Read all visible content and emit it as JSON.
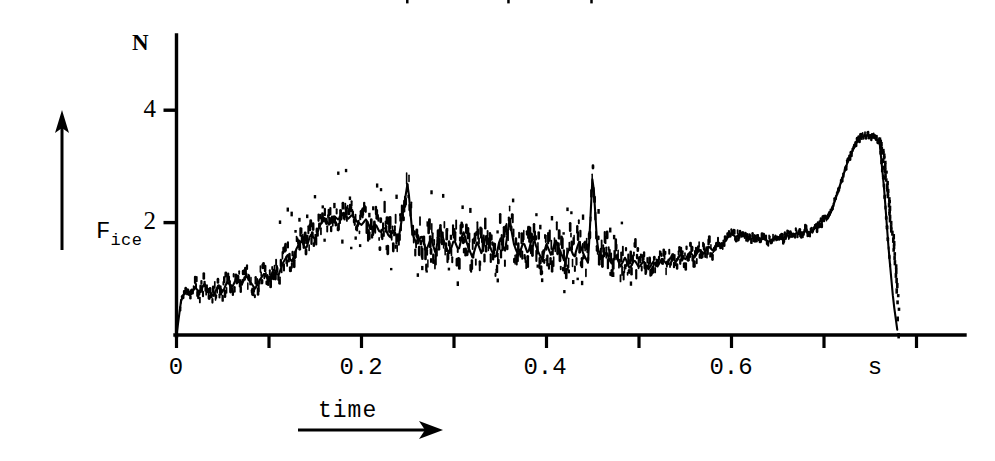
{
  "figure": {
    "background": "#ffffff",
    "ink_color": "#000000"
  },
  "axes": {
    "y_unit_label": "N",
    "y_axis_label_main": "F",
    "y_axis_label_sub": "ice",
    "y_ticks": [
      {
        "value": 2,
        "label": "2"
      },
      {
        "value": 4,
        "label": "4"
      }
    ],
    "x_ticks": [
      {
        "value": 0.0,
        "label": "0"
      },
      {
        "value": 0.1,
        "label": ""
      },
      {
        "value": 0.2,
        "label": "0.2"
      },
      {
        "value": 0.3,
        "label": ""
      },
      {
        "value": 0.4,
        "label": "0.4"
      },
      {
        "value": 0.5,
        "label": ""
      },
      {
        "value": 0.6,
        "label": "0.6"
      },
      {
        "value": 0.7,
        "label": ""
      },
      {
        "value": 0.8,
        "label": ""
      }
    ],
    "x_unit_label": "s",
    "x_axis_label": "time",
    "x_axis_arrow": "arrow-right",
    "y_axis_arrow": "arrow-up"
  },
  "chart_data": {
    "type": "line",
    "title": "",
    "subtitle": "",
    "xlabel": "time",
    "ylabel": "F_ice",
    "xunit": "s",
    "yunit": "N",
    "xlim": [
      0.0,
      0.83
    ],
    "ylim": [
      0.0,
      4.55
    ],
    "grid": false,
    "legend": null,
    "style": "noisy dotted oscilloscope trace, black ink on white",
    "annotations": [],
    "series": [
      {
        "name": "F_ice",
        "x": [
          0.0,
          0.005,
          0.01,
          0.015,
          0.02,
          0.025,
          0.03,
          0.035,
          0.04,
          0.045,
          0.05,
          0.055,
          0.06,
          0.065,
          0.07,
          0.075,
          0.08,
          0.085,
          0.09,
          0.095,
          0.1,
          0.105,
          0.11,
          0.115,
          0.12,
          0.125,
          0.13,
          0.135,
          0.14,
          0.145,
          0.15,
          0.155,
          0.16,
          0.165,
          0.17,
          0.175,
          0.18,
          0.185,
          0.19,
          0.195,
          0.2,
          0.205,
          0.21,
          0.215,
          0.22,
          0.225,
          0.23,
          0.235,
          0.24,
          0.245,
          0.25,
          0.255,
          0.26,
          0.265,
          0.27,
          0.275,
          0.28,
          0.285,
          0.29,
          0.295,
          0.3,
          0.305,
          0.31,
          0.315,
          0.32,
          0.325,
          0.33,
          0.335,
          0.34,
          0.345,
          0.35,
          0.355,
          0.36,
          0.365,
          0.37,
          0.375,
          0.38,
          0.385,
          0.39,
          0.395,
          0.4,
          0.405,
          0.41,
          0.415,
          0.42,
          0.425,
          0.43,
          0.435,
          0.44,
          0.445,
          0.45,
          0.455,
          0.46,
          0.465,
          0.47,
          0.475,
          0.48,
          0.485,
          0.49,
          0.495,
          0.5,
          0.505,
          0.51,
          0.515,
          0.52,
          0.525,
          0.53,
          0.535,
          0.54,
          0.545,
          0.55,
          0.555,
          0.56,
          0.565,
          0.57,
          0.575,
          0.58,
          0.585,
          0.59,
          0.595,
          0.6,
          0.605,
          0.61,
          0.615,
          0.62,
          0.625,
          0.63,
          0.635,
          0.64,
          0.645,
          0.65,
          0.655,
          0.66,
          0.665,
          0.67,
          0.675,
          0.68,
          0.685,
          0.69,
          0.695,
          0.7,
          0.705,
          0.71,
          0.715,
          0.72,
          0.725,
          0.73,
          0.735,
          0.74,
          0.745,
          0.75,
          0.755,
          0.76,
          0.765,
          0.77,
          0.775,
          0.78
        ],
        "y": [
          0.0,
          0.62,
          0.8,
          0.7,
          0.86,
          0.74,
          0.92,
          0.78,
          0.7,
          0.88,
          0.76,
          0.96,
          0.84,
          1.02,
          0.88,
          1.06,
          0.94,
          0.82,
          0.98,
          1.1,
          0.95,
          1.18,
          1.05,
          1.28,
          1.42,
          1.3,
          1.55,
          1.68,
          1.52,
          1.8,
          1.7,
          1.95,
          2.08,
          1.96,
          2.12,
          2.05,
          2.18,
          2.06,
          2.14,
          2.02,
          1.96,
          2.06,
          1.88,
          1.98,
          1.82,
          1.92,
          1.74,
          1.86,
          1.7,
          2.2,
          2.72,
          1.8,
          1.6,
          1.78,
          1.5,
          1.72,
          1.46,
          1.92,
          1.62,
          1.44,
          1.7,
          1.5,
          1.85,
          1.58,
          1.38,
          1.66,
          1.44,
          1.8,
          1.52,
          1.36,
          1.74,
          1.48,
          2.05,
          1.6,
          1.4,
          1.66,
          1.44,
          1.78,
          1.52,
          1.34,
          1.62,
          1.42,
          1.7,
          1.48,
          1.3,
          1.58,
          1.38,
          1.66,
          1.44,
          1.28,
          2.9,
          1.55,
          1.36,
          1.48,
          1.26,
          1.42,
          1.22,
          1.38,
          1.18,
          1.34,
          1.2,
          1.32,
          1.16,
          1.3,
          1.22,
          1.36,
          1.26,
          1.4,
          1.3,
          1.44,
          1.34,
          1.48,
          1.38,
          1.52,
          1.44,
          1.58,
          1.5,
          1.66,
          1.58,
          1.72,
          1.8,
          1.74,
          1.82,
          1.76,
          1.7,
          1.74,
          1.68,
          1.72,
          1.66,
          1.7,
          1.74,
          1.7,
          1.78,
          1.74,
          1.82,
          1.78,
          1.86,
          1.82,
          1.9,
          1.94,
          2.06,
          2.1,
          2.3,
          2.55,
          2.8,
          3.05,
          3.25,
          3.42,
          3.52,
          3.55,
          3.54,
          3.5,
          3.45,
          2.6,
          1.5,
          0.6,
          0.0
        ],
        "noise_band": 0.3,
        "peak_values": [
          {
            "x": 0.18,
            "y": 2.18,
            "label": "first peak"
          },
          {
            "x": 0.25,
            "y": 2.72,
            "label": "spike"
          },
          {
            "x": 0.36,
            "y": 2.05,
            "label": "spike"
          },
          {
            "x": 0.45,
            "y": 2.9,
            "label": "spike"
          },
          {
            "x": 0.745,
            "y": 3.55,
            "label": "final peak"
          }
        ]
      }
    ]
  }
}
